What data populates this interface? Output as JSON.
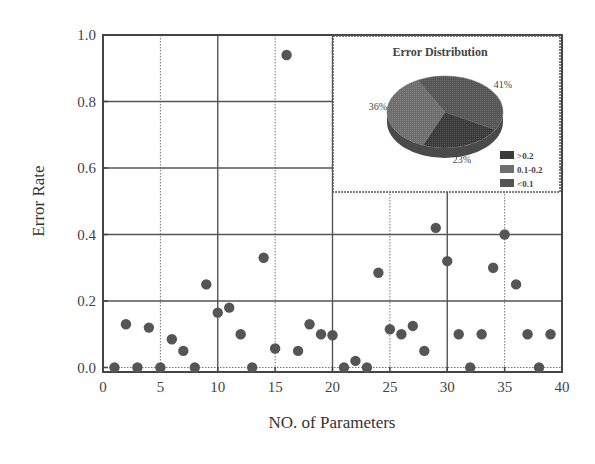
{
  "chart_data": {
    "type": "scatter",
    "title": "",
    "xlabel": "NO. of Parameters",
    "ylabel": "Error Rate",
    "xlim": [
      0,
      40
    ],
    "ylim": [
      0.0,
      1.0
    ],
    "xticks": [
      "0",
      "5",
      "10",
      "15",
      "20",
      "25",
      "30",
      "35",
      "40"
    ],
    "yticks": [
      "0.0",
      "0.2",
      "0.4",
      "0.6",
      "0.8",
      "1.0"
    ],
    "grid": true,
    "series": [
      {
        "name": "Error Rate",
        "color": "#555555",
        "x": [
          1,
          2,
          3,
          4,
          5,
          6,
          7,
          8,
          9,
          10,
          11,
          12,
          13,
          14,
          15,
          16,
          17,
          18,
          19,
          20,
          21,
          22,
          23,
          24,
          25,
          26,
          27,
          28,
          29,
          30,
          31,
          32,
          33,
          34,
          35,
          36,
          37,
          38,
          39
        ],
        "y": [
          0.0,
          0.13,
          0.0,
          0.12,
          0.0,
          0.085,
          0.05,
          0.0,
          0.25,
          0.165,
          0.18,
          0.1,
          0.0,
          0.33,
          0.057,
          0.94,
          0.05,
          0.13,
          0.1,
          0.097,
          0.0,
          0.02,
          0.0,
          0.285,
          0.115,
          0.1,
          0.125,
          0.05,
          0.42,
          0.32,
          0.1,
          0.0,
          0.1,
          0.3,
          0.4,
          0.25,
          0.1,
          0.0,
          0.1
        ]
      }
    ],
    "inset": {
      "type": "pie",
      "title": "Error Distribution",
      "slices": [
        {
          "label": ">0.2",
          "value": 23,
          "text": "23%",
          "color": "#3a3a3a"
        },
        {
          "label": "0.1-0.2",
          "value": 36,
          "text": "36%",
          "color": "#6e6e6e"
        },
        {
          "label": "<0.1",
          "value": 41,
          "text": "41%",
          "color": "#555555"
        }
      ],
      "legend": [
        ">0.2",
        "0.1-0.2",
        "<0.1"
      ],
      "legend_position": "lower-right"
    }
  }
}
